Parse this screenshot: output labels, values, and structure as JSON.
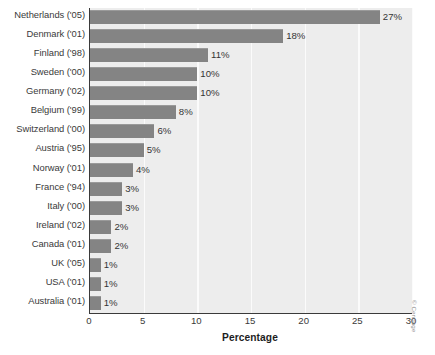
{
  "chart_data": {
    "type": "bar",
    "orientation": "horizontal",
    "title": "",
    "xlabel": "Percentage",
    "ylabel": "",
    "xlim": [
      0,
      30
    ],
    "xticks": [
      0,
      5,
      10,
      15,
      20,
      25,
      30
    ],
    "xtick_labels": [
      "0",
      "5",
      "10",
      "15",
      "20",
      "25",
      "30"
    ],
    "grid": true,
    "grid_axis": "x",
    "legend": false,
    "categories": [
      "Netherlands ('05)",
      "Denmark ('01)",
      "Finland ('98)",
      "Sweden ('00)",
      "Germany ('02)",
      "Belgium ('99)",
      "Switzerland ('00)",
      "Austria ('95)",
      "Norway ('01)",
      "France ('94)",
      "Italy ('00)",
      "Ireland ('02)",
      "Canada ('01)",
      "UK ('05)",
      "USA ('01)",
      "Australia ('01)"
    ],
    "values": [
      27,
      18,
      11,
      10,
      10,
      8,
      6,
      5,
      4,
      3,
      3,
      2,
      2,
      1,
      1,
      1
    ],
    "value_labels": [
      "27%",
      "18%",
      "11%",
      "10%",
      "10%",
      "8%",
      "6%",
      "5%",
      "4%",
      "3%",
      "3%",
      "2%",
      "2%",
      "1%",
      "1%",
      "1%"
    ],
    "colors": {
      "bar": "#848484",
      "plot_background": "#ededed",
      "gridline": "#fbfbfb",
      "axis": "#3a3a3a",
      "text": "#343434"
    }
  },
  "credit": "© Cengage"
}
